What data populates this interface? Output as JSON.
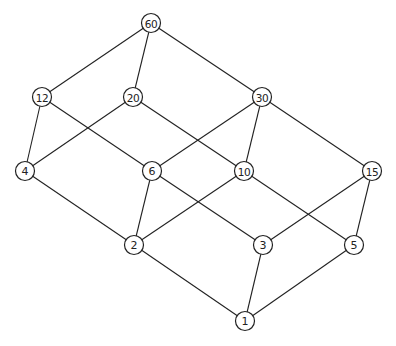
{
  "diagram": {
    "type": "hasse",
    "title": "",
    "nodes": [
      {
        "id": "60",
        "label": "60",
        "x": 151,
        "y": 23
      },
      {
        "id": "12",
        "label": "12",
        "x": 42,
        "y": 97
      },
      {
        "id": "20",
        "label": "20",
        "x": 133,
        "y": 97
      },
      {
        "id": "30",
        "label": "30",
        "x": 262,
        "y": 97
      },
      {
        "id": "4",
        "label": "4",
        "x": 25,
        "y": 171
      },
      {
        "id": "6",
        "label": "6",
        "x": 152,
        "y": 171
      },
      {
        "id": "10",
        "label": "10",
        "x": 244,
        "y": 171
      },
      {
        "id": "15",
        "label": "15",
        "x": 372,
        "y": 171
      },
      {
        "id": "2",
        "label": "2",
        "x": 134,
        "y": 245
      },
      {
        "id": "3",
        "label": "3",
        "x": 263,
        "y": 245
      },
      {
        "id": "5",
        "label": "5",
        "x": 354,
        "y": 245
      },
      {
        "id": "1",
        "label": "1",
        "x": 245,
        "y": 321
      }
    ],
    "edges": [
      [
        "60",
        "12"
      ],
      [
        "60",
        "20"
      ],
      [
        "60",
        "30"
      ],
      [
        "12",
        "4"
      ],
      [
        "12",
        "6"
      ],
      [
        "20",
        "4"
      ],
      [
        "20",
        "10"
      ],
      [
        "30",
        "6"
      ],
      [
        "30",
        "10"
      ],
      [
        "30",
        "15"
      ],
      [
        "4",
        "2"
      ],
      [
        "6",
        "2"
      ],
      [
        "6",
        "3"
      ],
      [
        "10",
        "2"
      ],
      [
        "10",
        "5"
      ],
      [
        "15",
        "3"
      ],
      [
        "15",
        "5"
      ],
      [
        "2",
        "1"
      ],
      [
        "3",
        "1"
      ],
      [
        "5",
        "1"
      ]
    ]
  }
}
